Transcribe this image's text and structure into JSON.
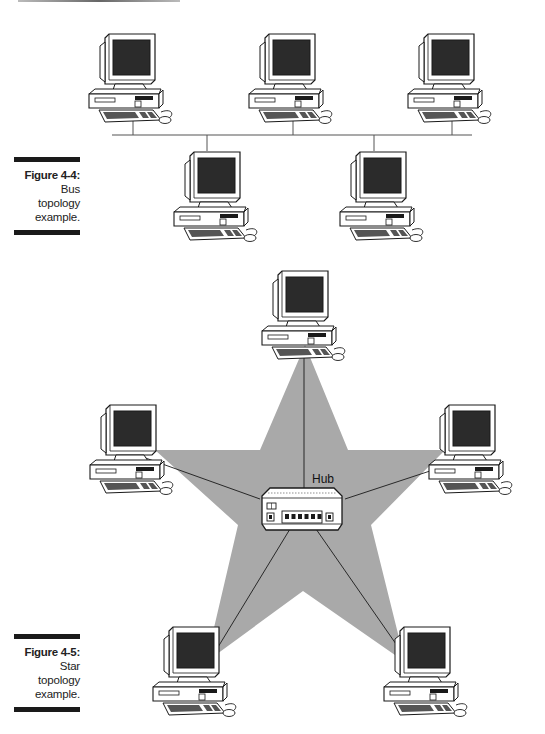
{
  "figures": [
    {
      "id": "figure-4-4",
      "label": "Figure 4-4:",
      "caption_lines": [
        "Bus",
        "topology",
        "example."
      ],
      "topology": "bus",
      "nodes": [
        {
          "type": "computer",
          "row": "top",
          "index": 1
        },
        {
          "type": "computer",
          "row": "top",
          "index": 2
        },
        {
          "type": "computer",
          "row": "top",
          "index": 3
        },
        {
          "type": "computer",
          "row": "bottom",
          "index": 1
        },
        {
          "type": "computer",
          "row": "bottom",
          "index": 2
        }
      ]
    },
    {
      "id": "figure-4-5",
      "label": "Figure 4-5:",
      "caption_lines": [
        "Star",
        "topology",
        "example."
      ],
      "topology": "star",
      "hub_label": "Hub",
      "hub_ports": 6,
      "nodes": [
        {
          "type": "computer",
          "position": "top"
        },
        {
          "type": "computer",
          "position": "left"
        },
        {
          "type": "computer",
          "position": "right"
        },
        {
          "type": "computer",
          "position": "bottom-left"
        },
        {
          "type": "computer",
          "position": "bottom-right"
        }
      ]
    }
  ],
  "colors": {
    "ink": "#1a1a1a",
    "screen": "#2b2b2b",
    "star_fill": "#a9a9a9",
    "paper": "#ffffff",
    "bus_line": "#555555"
  }
}
